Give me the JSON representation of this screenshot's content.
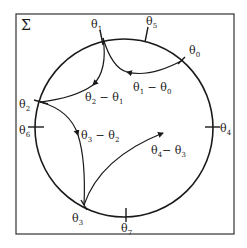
{
  "diagram": {
    "frame_label": "Σ",
    "points": [
      {
        "id": "theta0",
        "base": "θ",
        "sub": "0"
      },
      {
        "id": "theta1",
        "base": "θ",
        "sub": "1"
      },
      {
        "id": "theta2",
        "base": "θ",
        "sub": "2"
      },
      {
        "id": "theta3",
        "base": "θ",
        "sub": "3"
      },
      {
        "id": "theta4",
        "base": "θ",
        "sub": "4"
      },
      {
        "id": "theta5",
        "base": "θ",
        "sub": "5"
      },
      {
        "id": "theta6",
        "base": "θ",
        "sub": "6"
      },
      {
        "id": "theta7",
        "base": "θ",
        "sub": "7"
      }
    ],
    "arrows": [
      {
        "id": "a10",
        "label_a": "θ",
        "sub_a": "1",
        "minus": " − ",
        "label_b": "θ",
        "sub_b": "0"
      },
      {
        "id": "a21",
        "label_a": "θ",
        "sub_a": "2",
        "minus": " − ",
        "label_b": "θ",
        "sub_b": "1"
      },
      {
        "id": "a32",
        "label_a": "θ",
        "sub_a": "3",
        "minus": " − ",
        "label_b": "θ",
        "sub_b": "2"
      },
      {
        "id": "a43",
        "label_a": "θ",
        "sub_a": "4",
        "minus": "− ",
        "label_b": "θ",
        "sub_b": "3"
      }
    ]
  }
}
